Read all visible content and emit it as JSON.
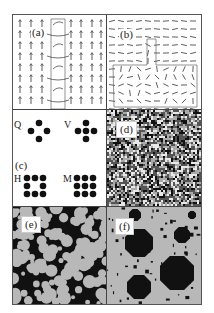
{
  "figure": {
    "panels": [
      {
        "id": "a",
        "label": "(a)",
        "description": "vector field of upward arrows with a vertical strip of curling arrows"
      },
      {
        "id": "b",
        "label": "(b)",
        "description": "horizontal director field with T-shaped region of disordered directors"
      },
      {
        "id": "c",
        "label": "(c)",
        "description": "dot patterns",
        "patterns": [
          {
            "letter": "Q",
            "dots": 4,
            "shape": "diamond"
          },
          {
            "letter": "V",
            "dots": 5,
            "shape": "plus"
          },
          {
            "letter": "H",
            "dots": 8,
            "shape": "3x3 ring"
          },
          {
            "letter": "M",
            "dots": 9,
            "shape": "3x3 full"
          }
        ]
      },
      {
        "id": "d",
        "label": "(d)",
        "description": "random noise texture"
      },
      {
        "id": "e",
        "label": "(e)",
        "description": "black and grey coarsening domains"
      },
      {
        "id": "f",
        "label": "(f)",
        "description": "octagonal black domains in grey matrix"
      }
    ]
  },
  "colors": {
    "frame": "#444444",
    "ink": "#111111",
    "grey": "#b8b8b8",
    "background": "#ffffff"
  }
}
